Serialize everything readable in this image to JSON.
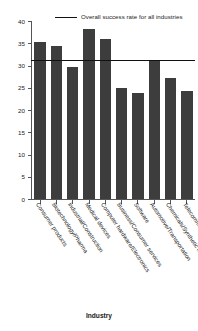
{
  "chart_data": {
    "type": "bar",
    "title": "",
    "xlabel": "Industry",
    "ylabel": "",
    "ylim": [
      0,
      40
    ],
    "yticks": [
      0,
      5,
      10,
      15,
      20,
      25,
      30,
      35,
      40
    ],
    "grid": false,
    "legend_position": "top-right",
    "categories": [
      "Consumer products",
      "Biotechnology/Pharma",
      "Industrial/Construction",
      "Medical devices",
      "Computer hardware/Electronics",
      "Business/Consumer services",
      "Software",
      "Automotive/Transportation",
      "Chemicals/Synthetic materials",
      "Telecommunications"
    ],
    "values": [
      35.2,
      34.4,
      29.7,
      38.3,
      36.0,
      25.0,
      23.8,
      31.3,
      27.3,
      24.3
    ],
    "annotations": [
      {
        "type": "hline",
        "label": "Overall success rate for all industries",
        "value": 31.3
      }
    ],
    "colors": {
      "bar": "#3d3d3d",
      "refline": "#111111",
      "axis": "#555555",
      "text": "#1a1a1a",
      "background": "#ffffff"
    }
  },
  "legend": {
    "label": "Overall success rate for all industries"
  },
  "axis": {
    "x_title": "Industry"
  }
}
